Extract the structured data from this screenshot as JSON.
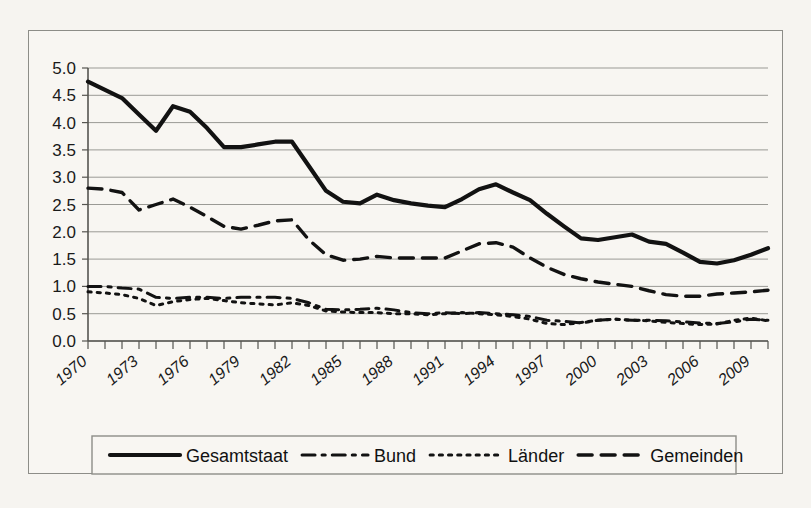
{
  "chart_data": {
    "type": "line",
    "title": "",
    "xlabel": "",
    "ylabel": "",
    "ylim": [
      0.0,
      5.0
    ],
    "xlim": [
      1970,
      2010
    ],
    "grid": true,
    "legend_position": "bottom",
    "ytick_labels": [
      "5.0",
      "4.5",
      "4.0",
      "3.5",
      "3.0",
      "2.5",
      "2.0",
      "1.5",
      "1.0",
      "0.5",
      "0.0"
    ],
    "ytick_values": [
      5.0,
      4.5,
      4.0,
      3.5,
      3.0,
      2.5,
      2.0,
      1.5,
      1.0,
      0.5,
      0.0
    ],
    "xtick_labels": [
      "1970",
      "1973",
      "1976",
      "1979",
      "1982",
      "1985",
      "1988",
      "1991",
      "1994",
      "1997",
      "2000",
      "2003",
      "2006",
      "2009"
    ],
    "xtick_values": [
      1970,
      1973,
      1976,
      1979,
      1982,
      1985,
      1988,
      1991,
      1994,
      1997,
      2000,
      2003,
      2006,
      2009
    ],
    "x": [
      1970,
      1971,
      1972,
      1973,
      1974,
      1975,
      1976,
      1977,
      1978,
      1979,
      1980,
      1981,
      1982,
      1983,
      1984,
      1985,
      1986,
      1987,
      1988,
      1989,
      1990,
      1991,
      1992,
      1993,
      1994,
      1995,
      1996,
      1997,
      1998,
      1999,
      2000,
      2001,
      2002,
      2003,
      2004,
      2005,
      2006,
      2007,
      2008,
      2009,
      2010
    ],
    "series": [
      {
        "name": "Gesamtstaat",
        "style": "solid",
        "width": 4.2,
        "color": "#121212",
        "values": [
          4.75,
          4.6,
          4.45,
          4.15,
          3.85,
          4.3,
          4.2,
          3.9,
          3.55,
          3.55,
          3.6,
          3.65,
          3.65,
          3.2,
          2.75,
          2.55,
          2.52,
          2.68,
          2.58,
          2.52,
          2.48,
          2.45,
          2.6,
          2.78,
          2.87,
          2.72,
          2.58,
          2.33,
          2.1,
          1.88,
          1.85,
          1.9,
          1.95,
          1.82,
          1.78,
          1.62,
          1.45,
          1.42,
          1.48,
          1.58,
          1.7
        ]
      },
      {
        "name": "Bund",
        "style": "dashdot",
        "width": 3.0,
        "color": "#121212",
        "values": [
          1.0,
          1.0,
          0.97,
          0.95,
          0.8,
          0.78,
          0.8,
          0.8,
          0.78,
          0.8,
          0.8,
          0.8,
          0.78,
          0.7,
          0.58,
          0.57,
          0.58,
          0.6,
          0.57,
          0.52,
          0.5,
          0.52,
          0.5,
          0.52,
          0.5,
          0.48,
          0.45,
          0.38,
          0.36,
          0.33,
          0.38,
          0.4,
          0.38,
          0.38,
          0.37,
          0.35,
          0.33,
          0.32,
          0.35,
          0.4,
          0.38
        ]
      },
      {
        "name": "Länder",
        "style": "dotted",
        "width": 3.0,
        "color": "#121212",
        "values": [
          0.9,
          0.88,
          0.85,
          0.78,
          0.65,
          0.72,
          0.76,
          0.78,
          0.74,
          0.7,
          0.68,
          0.66,
          0.7,
          0.65,
          0.55,
          0.53,
          0.52,
          0.52,
          0.5,
          0.5,
          0.48,
          0.5,
          0.52,
          0.5,
          0.48,
          0.45,
          0.4,
          0.32,
          0.3,
          0.34,
          0.38,
          0.4,
          0.38,
          0.37,
          0.34,
          0.32,
          0.3,
          0.31,
          0.38,
          0.42,
          0.37
        ]
      },
      {
        "name": "Gemeinden",
        "style": "dashed",
        "width": 3.4,
        "color": "#121212",
        "values": [
          2.8,
          2.78,
          2.72,
          2.4,
          2.5,
          2.6,
          2.45,
          2.28,
          2.1,
          2.05,
          2.12,
          2.2,
          2.22,
          1.85,
          1.58,
          1.48,
          1.5,
          1.55,
          1.52,
          1.52,
          1.52,
          1.52,
          1.65,
          1.78,
          1.8,
          1.72,
          1.52,
          1.35,
          1.22,
          1.14,
          1.08,
          1.04,
          1.0,
          0.92,
          0.85,
          0.82,
          0.82,
          0.86,
          0.88,
          0.9,
          0.93
        ]
      }
    ]
  },
  "legend": {
    "items": [
      {
        "label": "Gesamtstaat",
        "style": "solid"
      },
      {
        "label": "Bund",
        "style": "dashdot"
      },
      {
        "label": "Länder",
        "style": "dotted"
      },
      {
        "label": "Gemeinden",
        "style": "dashed"
      }
    ]
  },
  "colors": {
    "ink": "#121212",
    "grid": "#9a9a95",
    "frame": "#8d8d88",
    "paper": "#f6f4f0"
  }
}
